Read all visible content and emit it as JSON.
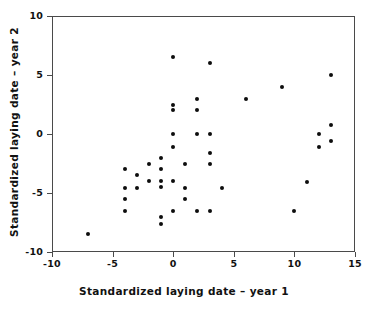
{
  "chart_data": {
    "type": "scatter",
    "title": "",
    "xlabel": "Standardized laying date – year 1",
    "ylabel": "Standardized laying date – year 2",
    "xlim": [
      -10,
      15
    ],
    "ylim": [
      -10,
      10
    ],
    "xticks": [
      -10,
      -5,
      0,
      5,
      10,
      15
    ],
    "yticks": [
      -10,
      -5,
      0,
      5,
      10
    ],
    "xtick_labels": [
      "-10",
      "-5",
      "0",
      "5",
      "10",
      "15"
    ],
    "ytick_labels": [
      "-10",
      "-5",
      "0",
      "5",
      "10"
    ],
    "grid": false,
    "legend": null,
    "marker": "filled-circle",
    "marker_color": "#0d0d0d",
    "frame_color": "#4a4a4a",
    "background": "#ffffff",
    "series": [
      {
        "name": "birds",
        "points": [
          [
            -7.0,
            -8.5
          ],
          [
            -4.0,
            -3.0
          ],
          [
            -4.0,
            -4.6
          ],
          [
            -4.0,
            -5.5
          ],
          [
            -4.0,
            -6.5
          ],
          [
            -3.0,
            -3.5
          ],
          [
            -3.0,
            -4.6
          ],
          [
            -2.0,
            -2.5
          ],
          [
            -2.0,
            -4.0
          ],
          [
            -1.0,
            -2.0
          ],
          [
            -1.0,
            -3.0
          ],
          [
            -1.0,
            -4.0
          ],
          [
            -1.0,
            -4.5
          ],
          [
            -1.0,
            -7.0
          ],
          [
            -1.0,
            -7.6
          ],
          [
            0.0,
            6.5
          ],
          [
            0.0,
            2.5
          ],
          [
            0.0,
            2.0
          ],
          [
            0.0,
            0.0
          ],
          [
            0.0,
            -1.1
          ],
          [
            0.0,
            -4.0
          ],
          [
            0.0,
            -6.5
          ],
          [
            1.0,
            -2.5
          ],
          [
            1.0,
            -4.6
          ],
          [
            1.0,
            -5.5
          ],
          [
            2.0,
            3.0
          ],
          [
            2.0,
            2.0
          ],
          [
            2.0,
            0.0
          ],
          [
            2.0,
            -6.5
          ],
          [
            3.0,
            6.0
          ],
          [
            3.0,
            0.0
          ],
          [
            3.0,
            -1.6
          ],
          [
            3.0,
            -2.5
          ],
          [
            3.0,
            -6.5
          ],
          [
            4.0,
            -4.6
          ],
          [
            6.0,
            3.0
          ],
          [
            9.0,
            4.0
          ],
          [
            10.0,
            -6.5
          ],
          [
            11.0,
            -4.1
          ],
          [
            12.0,
            0.0
          ],
          [
            12.0,
            -1.1
          ],
          [
            13.0,
            5.0
          ],
          [
            13.0,
            0.8
          ],
          [
            13.0,
            -0.6
          ]
        ]
      }
    ]
  },
  "axes": {
    "x_title": "Standardized laying date – year 1",
    "y_title": "Standardized laying date – year 2"
  }
}
